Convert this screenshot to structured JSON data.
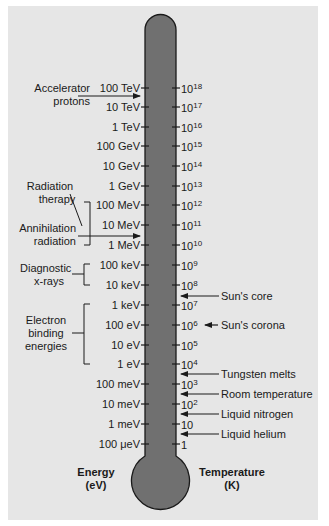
{
  "colors": {
    "panel_background": "#e6e6e6",
    "thermometer_fill": "#707070",
    "thermometer_outline": "#1a1a1a",
    "text": "#1a1a1a"
  },
  "axes": {
    "energy_title": "Energy",
    "energy_unit": "(eV)",
    "temperature_title": "Temperature",
    "temperature_unit": "(K)"
  },
  "energy_ticks": [
    {
      "label": "100 TeV",
      "y": 88
    },
    {
      "label": "10 TeV",
      "y": 107
    },
    {
      "label": "1 TeV",
      "y": 127
    },
    {
      "label": "100 GeV",
      "y": 146
    },
    {
      "label": "10 GeV",
      "y": 166
    },
    {
      "label": "1 GeV",
      "y": 186
    },
    {
      "label": "100 MeV",
      "y": 205
    },
    {
      "label": "10 MeV",
      "y": 225
    },
    {
      "label": "1 MeV",
      "y": 245
    },
    {
      "label": "100 keV",
      "y": 265
    },
    {
      "label": "10 keV",
      "y": 285
    },
    {
      "label": "1 keV",
      "y": 305
    },
    {
      "label": "100 eV",
      "y": 325
    },
    {
      "label": "10 eV",
      "y": 345
    },
    {
      "label": "1 eV",
      "y": 364
    },
    {
      "label": "100 meV",
      "y": 384
    },
    {
      "label": "10 meV",
      "y": 404
    },
    {
      "label": "1 meV",
      "y": 424
    },
    {
      "label": "100 μeV",
      "y": 444
    }
  ],
  "temperature_ticks": [
    {
      "base": "10",
      "exp": "18",
      "y": 88
    },
    {
      "base": "10",
      "exp": "17",
      "y": 107
    },
    {
      "base": "10",
      "exp": "16",
      "y": 127
    },
    {
      "base": "10",
      "exp": "15",
      "y": 146
    },
    {
      "base": "10",
      "exp": "14",
      "y": 166
    },
    {
      "base": "10",
      "exp": "13",
      "y": 186
    },
    {
      "base": "10",
      "exp": "12",
      "y": 205
    },
    {
      "base": "10",
      "exp": "11",
      "y": 225
    },
    {
      "base": "10",
      "exp": "10",
      "y": 245
    },
    {
      "base": "10",
      "exp": "9",
      "y": 265
    },
    {
      "base": "10",
      "exp": "8",
      "y": 285
    },
    {
      "base": "10",
      "exp": "7",
      "y": 305
    },
    {
      "base": "10",
      "exp": "6",
      "y": 325
    },
    {
      "base": "10",
      "exp": "5",
      "y": 345
    },
    {
      "base": "10",
      "exp": "4",
      "y": 364
    },
    {
      "base": "10",
      "exp": "3",
      "y": 384
    },
    {
      "base": "10",
      "exp": "2",
      "y": 404
    },
    {
      "base": "10",
      "exp": "",
      "y": 424
    },
    {
      "base": "1",
      "exp": "",
      "y": 444
    }
  ],
  "energy_annotations": [
    {
      "lines": [
        "Accelerator",
        "protons"
      ]
    },
    {
      "lines": [
        "Radiation",
        "therapy"
      ]
    },
    {
      "lines": [
        "Annihilation",
        "radiation"
      ]
    },
    {
      "lines": [
        "Diagnostic",
        "x-rays"
      ]
    },
    {
      "lines": [
        "Electron",
        "binding",
        "energies"
      ]
    }
  ],
  "temperature_annotations": [
    {
      "label": "Sun's core"
    },
    {
      "label": "Sun's corona"
    },
    {
      "label": "Tungsten melts"
    },
    {
      "label": "Room temperature"
    },
    {
      "label": "Liquid nitrogen"
    },
    {
      "label": "Liquid helium"
    }
  ]
}
